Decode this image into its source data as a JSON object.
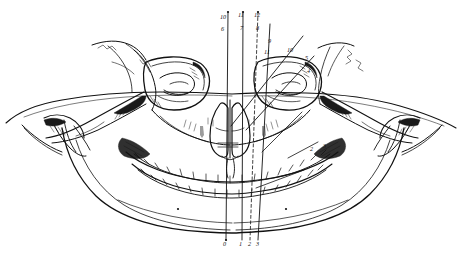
{
  "figure": {
    "background_color": "#ffffff",
    "ink_color": "#111111",
    "medium": "line engraving"
  },
  "labels": {
    "top": [
      {
        "id": "t10",
        "text": "10",
        "x": 222,
        "y": 19
      },
      {
        "id": "t11",
        "text": "11",
        "x": 240,
        "y": 17
      },
      {
        "id": "t12",
        "text": "12",
        "x": 256,
        "y": 17
      },
      {
        "id": "t6",
        "text": "6",
        "x": 221,
        "y": 31
      },
      {
        "id": "t7",
        "text": "7",
        "x": 240,
        "y": 30
      },
      {
        "id": "t8",
        "text": "8",
        "x": 256,
        "y": 30
      }
    ],
    "right_upper": [
      {
        "id": "r9",
        "text": "9",
        "x": 268,
        "y": 43
      },
      {
        "id": "r11",
        "text": "11",
        "x": 266,
        "y": 53
      },
      {
        "id": "r10",
        "text": "10",
        "x": 288,
        "y": 52
      },
      {
        "id": "r5",
        "text": "5",
        "x": 305,
        "y": 60
      },
      {
        "id": "r4",
        "text": "4",
        "x": 307,
        "y": 73
      }
    ],
    "right_lower": [
      {
        "id": "m2",
        "text": "2",
        "x": 310,
        "y": 151
      },
      {
        "id": "m3",
        "text": "3",
        "x": 323,
        "y": 148
      }
    ],
    "bottom": [
      {
        "id": "b0",
        "text": "0",
        "x": 222,
        "y": 245
      },
      {
        "id": "b1",
        "text": "1",
        "x": 240,
        "y": 245
      },
      {
        "id": "b2",
        "text": "2",
        "x": 249,
        "y": 245
      },
      {
        "id": "b3",
        "text": "3",
        "x": 256,
        "y": 245
      }
    ]
  },
  "reference_lines": [
    {
      "id": "line-0-midline",
      "style": "solid",
      "x1": 228,
      "y1": 12,
      "x2": 226,
      "y2": 240
    },
    {
      "id": "line-1",
      "style": "solid",
      "x1": 243,
      "y1": 12,
      "x2": 242,
      "y2": 240
    },
    {
      "id": "line-2",
      "style": "dashed",
      "x1": 258,
      "y1": 12,
      "x2": 250,
      "y2": 240
    },
    {
      "id": "line-3",
      "style": "solid",
      "x1": 268,
      "y1": 22,
      "x2": 258,
      "y2": 240
    },
    {
      "id": "line-4-oblique",
      "style": "solid",
      "x1": 303,
      "y1": 36,
      "x2": 231,
      "y2": 126
    },
    {
      "id": "line-5-oblique",
      "style": "solid",
      "x1": 312,
      "y1": 56,
      "x2": 246,
      "y2": 130
    },
    {
      "id": "line-6-pointer",
      "style": "solid",
      "x1": 300,
      "y1": 113,
      "x2": 262,
      "y2": 152
    },
    {
      "id": "line-7-pointer",
      "style": "solid",
      "x1": 316,
      "y1": 142,
      "x2": 286,
      "y2": 158
    },
    {
      "id": "line-8-pointer",
      "style": "solid",
      "x1": 302,
      "y1": 170,
      "x2": 256,
      "y2": 186
    }
  ],
  "anatomy_parts": [
    "frontal-bone",
    "left-orbit",
    "right-orbit",
    "nasal-aperture",
    "vomer",
    "zygomatic-arch-left",
    "zygomatic-arch-right",
    "maxilla-upper-teeth",
    "mandible-lower-teeth",
    "mandibular-body",
    "mastoid-process-left",
    "mastoid-process-right",
    "styloid-process-left",
    "styloid-process-right",
    "occipital-contour"
  ]
}
